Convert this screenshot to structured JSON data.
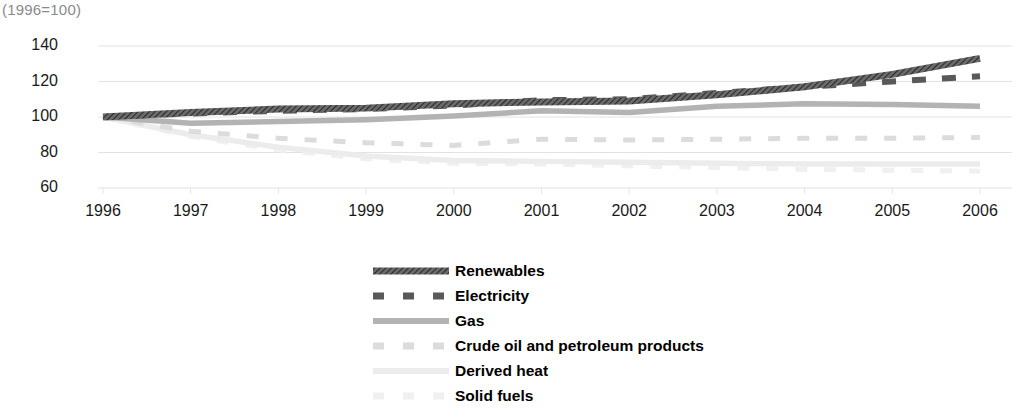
{
  "subtitle": "(1996=100)",
  "chart_data": {
    "type": "line",
    "title": "",
    "subtitle": "(1996=100)",
    "xlabel": "",
    "ylabel": "",
    "x": [
      1996,
      1997,
      1998,
      1999,
      2000,
      2001,
      2002,
      2003,
      2004,
      2005,
      2006
    ],
    "categories": [
      "1996",
      "1997",
      "1998",
      "1999",
      "2000",
      "2001",
      "2002",
      "2003",
      "2004",
      "2005",
      "2006"
    ],
    "xlim": [
      1996,
      2006
    ],
    "ylim": [
      60,
      140
    ],
    "yticks": [
      60,
      80,
      100,
      120,
      140
    ],
    "xticks": [
      "1996",
      "1997",
      "1998",
      "1999",
      "2000",
      "2001",
      "2002",
      "2003",
      "2004",
      "2005",
      "2006"
    ],
    "grid": true,
    "grid_axis": "y",
    "legend_position": "bottom-center",
    "series": [
      {
        "name": "Renewables",
        "color": "#4d4d4d",
        "style": "solid-hatched",
        "values": [
          100.0,
          102.5,
          104.5,
          105.0,
          107.5,
          108.5,
          109.0,
          112.5,
          117.0,
          124.0,
          133.0
        ]
      },
      {
        "name": "Electricity",
        "color": "#595959",
        "style": "dashed",
        "values": [
          100.0,
          102.0,
          103.5,
          104.5,
          106.5,
          109.5,
          110.0,
          113.5,
          117.0,
          120.0,
          123.0
        ]
      },
      {
        "name": "Gas",
        "color": "#b3b3b3",
        "style": "solid",
        "values": [
          100.0,
          96.5,
          97.5,
          98.5,
          100.5,
          103.5,
          102.5,
          106.0,
          107.5,
          107.0,
          106.0
        ]
      },
      {
        "name": "Crude oil and petroleum products",
        "color": "#dcdcdc",
        "style": "dashed",
        "values": [
          100.0,
          92.0,
          88.0,
          85.5,
          84.0,
          87.5,
          87.0,
          87.5,
          88.0,
          88.0,
          88.5
        ]
      },
      {
        "name": "Derived heat",
        "color": "#ececec",
        "style": "solid",
        "values": [
          100.0,
          90.0,
          83.0,
          78.0,
          75.5,
          75.0,
          74.5,
          74.0,
          73.5,
          73.5,
          73.5
        ]
      },
      {
        "name": "Solid fuels",
        "color": "#f0f0f0",
        "style": "dashed",
        "values": [
          100.0,
          89.0,
          81.5,
          76.5,
          74.0,
          73.5,
          72.5,
          71.5,
          70.5,
          70.0,
          69.5
        ]
      }
    ]
  },
  "yaxis": {
    "ticks": [
      "140",
      "120",
      "100",
      "80",
      "60"
    ]
  },
  "xaxis": {
    "ticks": [
      "1996",
      "1997",
      "1998",
      "1999",
      "2000",
      "2001",
      "2002",
      "2003",
      "2004",
      "2005",
      "2006"
    ]
  },
  "legend": {
    "items": [
      {
        "label": "Renewables"
      },
      {
        "label": "Electricity"
      },
      {
        "label": "Gas"
      },
      {
        "label": "Crude oil and petroleum products"
      },
      {
        "label": "Derived heat"
      },
      {
        "label": "Solid fuels"
      }
    ]
  }
}
